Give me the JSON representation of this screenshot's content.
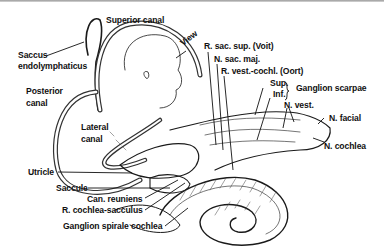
{
  "diagram": {
    "type": "anatomical-illustration",
    "colors": {
      "ink": "#111111",
      "background": "#ffffff"
    },
    "labels": [
      {
        "id": "superior-canal",
        "text": "Superior canal"
      },
      {
        "id": "saccus-1",
        "text": "Saccus"
      },
      {
        "id": "saccus-2",
        "text": "endolymphaticus"
      },
      {
        "id": "posterior-1",
        "text": "Posterior"
      },
      {
        "id": "posterior-2",
        "text": "canal"
      },
      {
        "id": "lateral-1",
        "text": "Lateral"
      },
      {
        "id": "lateral-2",
        "text": "canal"
      },
      {
        "id": "view",
        "text": "View"
      },
      {
        "id": "r-sac-sup",
        "text": "R. sac. sup. (Voit)"
      },
      {
        "id": "n-sac-maj",
        "text": "N. sac. maj."
      },
      {
        "id": "r-vest-cochl",
        "text": "R. vest.-cochl. (Oort)"
      },
      {
        "id": "sup",
        "text": "Sup."
      },
      {
        "id": "inf",
        "text": "Inf."
      },
      {
        "id": "ganglion-scarpae",
        "text": "Ganglion scarpae"
      },
      {
        "id": "n-vest",
        "text": "N. vest."
      },
      {
        "id": "n-facial",
        "text": "N. facial"
      },
      {
        "id": "n-cochlea",
        "text": "N. cochlea"
      },
      {
        "id": "utricle",
        "text": "Utricle"
      },
      {
        "id": "saccule",
        "text": "Saccule"
      },
      {
        "id": "can-reuniens",
        "text": "Can. reuniens"
      },
      {
        "id": "r-cochlea-sacculus",
        "text": "R. cochlea-sacculus"
      },
      {
        "id": "ganglion-spirale",
        "text": "Ganglion spirale cochlea"
      }
    ]
  }
}
